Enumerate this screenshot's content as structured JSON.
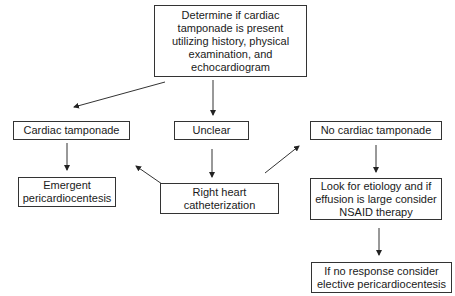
{
  "diagram": {
    "type": "flowchart",
    "nodes": {
      "start": "Determine if cardiac tamponade is present utilizing history, physical examination, and echocardiogram",
      "cardiac_tamponade": "Cardiac tamponade",
      "unclear": "Unclear",
      "no_cardiac_tamponade": "No cardiac tamponade",
      "emergent": "Emergent pericardiocentesis",
      "rhc": "Right heart catheterization",
      "look": "Look for etiology and if effusion is large consider NSAID therapy",
      "no_response": "If no response consider elective pericardiocentesis"
    },
    "edges": [
      {
        "from": "start",
        "to": "cardiac_tamponade"
      },
      {
        "from": "start",
        "to": "unclear"
      },
      {
        "from": "cardiac_tamponade",
        "to": "emergent"
      },
      {
        "from": "unclear",
        "to": "rhc"
      },
      {
        "from": "rhc",
        "to": "cardiac_tamponade"
      },
      {
        "from": "rhc",
        "to": "no_cardiac_tamponade"
      },
      {
        "from": "no_cardiac_tamponade",
        "to": "look"
      },
      {
        "from": "look",
        "to": "no_response"
      }
    ]
  }
}
